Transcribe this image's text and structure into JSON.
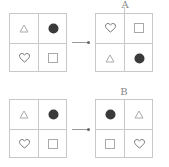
{
  "colors": {
    "grid_line": "#c8c8c8",
    "circle_fill": "#3a3a3a",
    "outline_shape": "#9a9a9a",
    "label": "#888888"
  },
  "rows": [
    {
      "source": {
        "cells": [
          "triangle",
          "circle",
          "heart",
          "square"
        ]
      },
      "result": {
        "label": "A",
        "cells": [
          "heart",
          "square",
          "triangle",
          "circle"
        ]
      }
    },
    {
      "source": {
        "cells": [
          "triangle",
          "circle",
          "heart",
          "square"
        ]
      },
      "result": {
        "label": "B",
        "cells": [
          "circle",
          "triangle",
          "square",
          "heart"
        ]
      }
    }
  ]
}
